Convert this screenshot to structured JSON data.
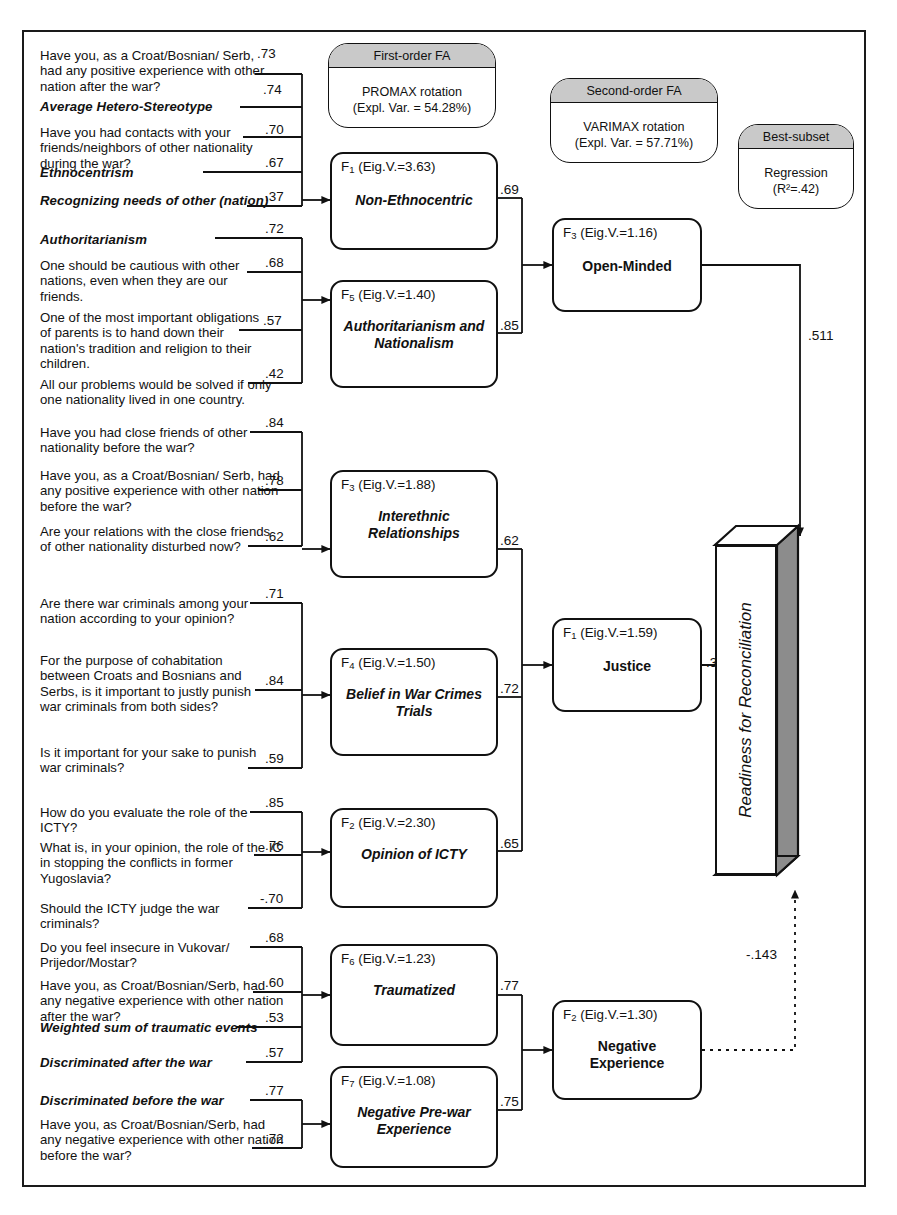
{
  "diagram": {
    "legend": [
      {
        "id": "first-order-fa",
        "header": "First-order FA",
        "line1": "PROMAX rotation",
        "line2": "(Expl. Var. = 54.28%)"
      },
      {
        "id": "second-order-fa",
        "header": "Second-order FA",
        "line1": "VARIMAX rotation",
        "line2": "(Expl. Var. = 57.71%)"
      },
      {
        "id": "best-subset",
        "header": "Best-subset",
        "line1": "Regression",
        "line2": "(R²=.42)"
      }
    ],
    "indicators": [
      {
        "text": "Have you, as a Croat/Bosnian/ Serb, had any positive experience with other nation after the war?",
        "bold": false,
        "loading": ".73"
      },
      {
        "text": "Average Hetero-Stereotype",
        "bold": true,
        "loading": ".74"
      },
      {
        "text": "Have you had contacts with your friends/neighbors of other nationality during the war?",
        "bold": false,
        "loading": ".70"
      },
      {
        "text": "Ethnocentrism",
        "bold": true,
        "loading": ".67"
      },
      {
        "text": "Recognizing needs of other (nation)",
        "bold": true,
        "loading": ".37"
      },
      {
        "text": "Authoritarianism",
        "bold": true,
        "loading": ".72"
      },
      {
        "text": "One should be cautious with other nations, even when they are our friends.",
        "bold": false,
        "loading": ".68"
      },
      {
        "text": "One of the most important obligations of parents is to hand down their nation's tradition and religion to their children.",
        "bold": false,
        "loading": ".57"
      },
      {
        "text": "All our problems would be solved if only one nationality lived in one country.",
        "bold": false,
        "loading": ".42"
      },
      {
        "text": "Have you had close friends of other nationality before the war?",
        "bold": false,
        "loading": ".84"
      },
      {
        "text": "Have you, as a Croat/Bosnian/ Serb, had any positive experience with other nation before the war?",
        "bold": false,
        "loading": ".78"
      },
      {
        "text": "Are your relations with the close friends of other nationality disturbed now?",
        "bold": false,
        "loading": ".62"
      },
      {
        "text": "Are there war criminals among your nation according to your opinion?",
        "bold": false,
        "loading": ".71"
      },
      {
        "text": "For the purpose of cohabitation between Croats and Bosnians and Serbs, is it important to justly punish war criminals from both sides?",
        "bold": false,
        "loading": ".84"
      },
      {
        "text": "Is it important for your sake to punish war criminals?",
        "bold": false,
        "loading": ".59"
      },
      {
        "text": "How do you evaluate the role of the ICTY?",
        "bold": false,
        "loading": ".85"
      },
      {
        "text": "What is, in your opinion, the role of the IC in stopping the conflicts in former Yugoslavia?",
        "bold": false,
        "loading": ".76"
      },
      {
        "text": "Should the ICTY judge the war criminals?",
        "bold": false,
        "loading": "-.70"
      },
      {
        "text": "Do you feel insecure in Vukovar/ Prijedor/Mostar?",
        "bold": false,
        "loading": ".68"
      },
      {
        "text": "Have you, as Croat/Bosnian/Serb, had any negative experience with other nation after the war?",
        "bold": false,
        "loading": ".60"
      },
      {
        "text": "Weighted sum of traumatic events",
        "bold": true,
        "loading": ".53"
      },
      {
        "text": "Discriminated after the war",
        "bold": true,
        "loading": ".57"
      },
      {
        "text": "Discriminated before the war",
        "bold": true,
        "loading": ".77"
      },
      {
        "text": "Have you, as Croat/Bosnian/Serb, had any negative experience with other nation before the war?",
        "bold": false,
        "loading": ".72"
      }
    ],
    "first_order_factors": [
      {
        "head": "F",
        "sub": "1",
        "eig": "(Eig.V.=3.63)",
        "name": "Non-Ethnocentric",
        "path": ".69"
      },
      {
        "head": "F",
        "sub": "5",
        "eig": "(Eig.V.=1.40)",
        "name": "Authoritarianism and Nationalism",
        "path": ".85"
      },
      {
        "head": "F",
        "sub": "3",
        "eig": "(Eig.V.=1.88)",
        "name": "Interethnic Relationships",
        "path": ".62"
      },
      {
        "head": "F",
        "sub": "4",
        "eig": "(Eig.V.=1.50)",
        "name": "Belief in War Crimes Trials",
        "path": ".72"
      },
      {
        "head": "F",
        "sub": "2",
        "eig": "(Eig.V.=2.30)",
        "name": "Opinion of ICTY",
        "path": ".65"
      },
      {
        "head": "F",
        "sub": "6",
        "eig": "(Eig.V.=1.23)",
        "name": "Traumatized",
        "path": ".77"
      },
      {
        "head": "F",
        "sub": "7",
        "eig": "(Eig.V.=1.08)",
        "name": "Negative Pre-war Experience",
        "path": ".75"
      }
    ],
    "second_order_factors": [
      {
        "head": "F",
        "sub": "3",
        "eig": "(Eig.V.=1.16)",
        "name": "Open-Minded",
        "path": ".511"
      },
      {
        "head": "F",
        "sub": "1",
        "eig": "(Eig.V.=1.59)",
        "name": "Justice",
        "path": ".365"
      },
      {
        "head": "F",
        "sub": "2",
        "eig": "(Eig.V.=1.30)",
        "name": "Negative Experience",
        "path": "-.143"
      }
    ],
    "outcome": {
      "label": "Readiness for Reconciliation"
    }
  }
}
